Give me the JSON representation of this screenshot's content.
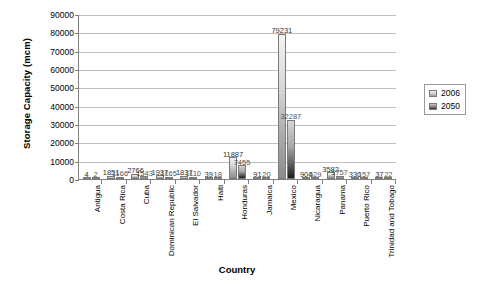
{
  "chart_data": {
    "type": "bar",
    "title": "",
    "xlabel": "Country",
    "ylabel": "Storage Capacity (mcm)",
    "ylim": [
      0,
      90000
    ],
    "ytick_labels": [
      "90000",
      "80000",
      "70000",
      "60000",
      "50000",
      "40000",
      "30000",
      "20000",
      "10000",
      "0"
    ],
    "ytick_values": [
      90000,
      80000,
      70000,
      60000,
      50000,
      40000,
      30000,
      20000,
      10000,
      0
    ],
    "grid": true,
    "legend_position": "right",
    "categories": [
      "Antigua",
      "Costa Rica",
      "Cuba",
      "Dominican Republic",
      "El Salvador",
      "Haiti",
      "Honduras",
      "Jamaica",
      "Mexico",
      "Nicaragua",
      "Panama",
      "Puerto Rico",
      "Trinidad and Tobago"
    ],
    "series": [
      {
        "name": "2006",
        "color": "#d9d9d9",
        "values": [
          4,
          1851,
          2766,
          1937,
          1837,
          39,
          11887,
          91,
          79231,
          904,
          3582,
          330,
          37
        ],
        "labels": [
          "4",
          "1851",
          "2766",
          "1937",
          "1837",
          "39",
          "11887",
          "91",
          "79231",
          "904",
          "3582",
          "330",
          "37"
        ]
      },
      {
        "name": "2050",
        "color": "#4d4d4d",
        "values": [
          2,
          1166,
          1543,
          1165,
          1110,
          18,
          7455,
          20,
          32287,
          529,
          1757,
          157,
          22
        ],
        "labels": [
          "2",
          "1166",
          "1543",
          "1165",
          "1110",
          "18",
          "7455",
          "20",
          "32287",
          "529",
          "1757",
          "157",
          "22"
        ]
      }
    ]
  }
}
